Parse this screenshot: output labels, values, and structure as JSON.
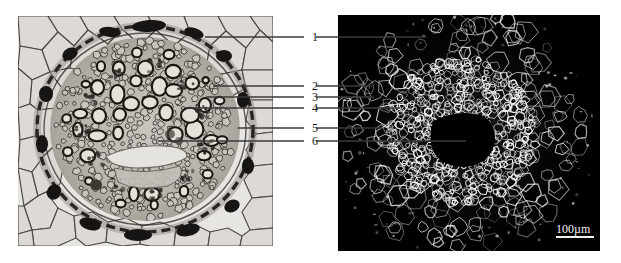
{
  "figure": {
    "kind": "plant-root-cross-section-comparison",
    "background_color": "#ffffff",
    "width": 621,
    "height": 263
  },
  "panels": [
    {
      "id": "brightfield",
      "name": "brightfield-micrograph",
      "description": "Stained transverse section of a root showing cortex, endodermis and central stele",
      "x": 18,
      "y": 16,
      "width": 255,
      "height": 230,
      "background_color": "#e9e7e4",
      "tissue_color": "#8a8884",
      "wall_color": "#1e1c1b"
    },
    {
      "id": "fluorescence",
      "name": "fluorescence-micrograph",
      "description": "UV autofluorescence image of the same root section on black background",
      "x": 338,
      "y": 15,
      "width": 262,
      "height": 236,
      "background_color": "#000000",
      "signal_color": "#e8e8e8"
    }
  ],
  "labels": [
    {
      "id": "1",
      "text": "1",
      "x": 309,
      "y": 31,
      "left_line": {
        "x1": 205,
        "y1": 37,
        "x2": 304,
        "y2": 37
      },
      "right_line": {
        "x1": 316,
        "y1": 37,
        "x2": 426,
        "y2": 37
      }
    },
    {
      "id": "2",
      "text": "2",
      "x": 309,
      "y": 80,
      "left_line": {
        "x1": 213,
        "y1": 86,
        "x2": 304,
        "y2": 86
      },
      "right_line": {
        "x1": 316,
        "y1": 86,
        "x2": 372,
        "y2": 86
      }
    },
    {
      "id": "3",
      "text": "3",
      "x": 309,
      "y": 91,
      "left_line": {
        "x1": 206,
        "y1": 97,
        "x2": 304,
        "y2": 97
      },
      "right_line": {
        "x1": 316,
        "y1": 97,
        "x2": 374,
        "y2": 97
      }
    },
    {
      "id": "4",
      "text": "4",
      "x": 309,
      "y": 102,
      "left_line": {
        "x1": 186,
        "y1": 108,
        "x2": 304,
        "y2": 108
      },
      "right_line": {
        "x1": 316,
        "y1": 108,
        "x2": 400,
        "y2": 108
      }
    },
    {
      "id": "5",
      "text": "5",
      "x": 309,
      "y": 122,
      "left_line": {
        "x1": 238,
        "y1": 128,
        "x2": 304,
        "y2": 128
      },
      "right_line": {
        "x1": 316,
        "y1": 128,
        "x2": 382,
        "y2": 128
      }
    },
    {
      "id": "6",
      "text": "6",
      "x": 309,
      "y": 135,
      "left_line": {
        "x1": 158,
        "y1": 141,
        "x2": 304,
        "y2": 141
      },
      "right_line": {
        "x1": 316,
        "y1": 141,
        "x2": 466,
        "y2": 141
      }
    }
  ],
  "scalebar": {
    "text": "100µm",
    "text_x": 556,
    "text_y": 223,
    "line_x": 556,
    "line_y": 236,
    "line_width": 38,
    "line_height": 2,
    "color": "#f0f0f0"
  }
}
